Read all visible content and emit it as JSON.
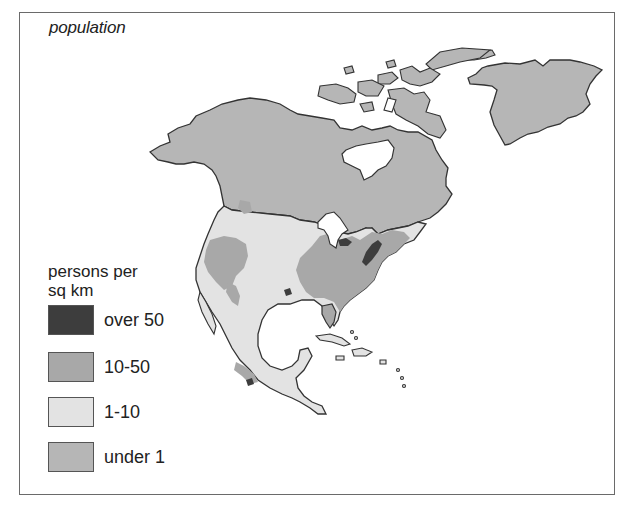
{
  "map": {
    "title": "population",
    "region": "North America",
    "colors": {
      "over_50": "#3d3d3d",
      "10_50": "#a8a8a8",
      "1_10": "#e3e3e3",
      "under_1": "#b6b6b6",
      "water": "#ffffff",
      "outline": "#333333"
    }
  },
  "legend": {
    "title_line1": "persons per",
    "title_line2": "sq km",
    "items": [
      {
        "label": "over 50",
        "color": "#3d3d3d"
      },
      {
        "label": "10-50",
        "color": "#a8a8a8"
      },
      {
        "label": "1-10",
        "color": "#e3e3e3"
      },
      {
        "label": "under 1",
        "color": "#b6b6b6"
      }
    ]
  }
}
